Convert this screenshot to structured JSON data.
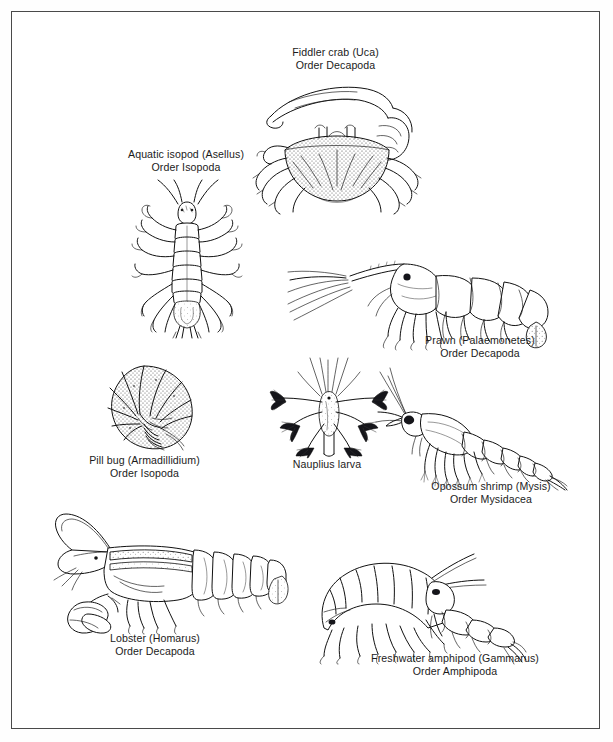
{
  "plate": {
    "title": "Crustacean diversity plate",
    "background_color": "#ffffff",
    "border_color": "#4a4a4a",
    "ink_color": "#111111",
    "caption_color": "#1b1b1b"
  },
  "figures": [
    {
      "id": "fiddler-crab",
      "common_name": "Fiddler crab (Uca)",
      "order": "Order Decapoda",
      "caption_lines": [
        "Fiddler crab (Uca)",
        "Order Decapoda"
      ]
    },
    {
      "id": "aquatic-isopod",
      "common_name": "Aquatic isopod (Asellus)",
      "order": "Order Isopoda",
      "caption_lines": [
        "Aquatic isopod (Asellus)",
        "Order Isopoda"
      ]
    },
    {
      "id": "prawn",
      "common_name": "Prawn (Palaemonetes)",
      "order": "Order Decapoda",
      "caption_lines": [
        "Prawn (Palaemonetes)",
        "Order Decapoda"
      ]
    },
    {
      "id": "pill-bug",
      "common_name": "Pill bug (Armadillidium)",
      "order": "Order Isopoda",
      "caption_lines": [
        "Pill bug (Armadillidium)",
        "Order Isopoda"
      ]
    },
    {
      "id": "nauplius-larva",
      "common_name": "Nauplius larva",
      "order": "",
      "caption_lines": [
        "Nauplius larva",
        ""
      ]
    },
    {
      "id": "opossum-shrimp",
      "common_name": "Opossum shrimp (Mysis)",
      "order": "Order Mysidacea",
      "caption_lines": [
        "Opossum shrimp (Mysis)",
        "Order Mysidacea"
      ]
    },
    {
      "id": "lobster",
      "common_name": "Lobster (Homarus)",
      "order": "Order Decapoda",
      "caption_lines": [
        "Lobster (Homarus)",
        "Order Decapoda"
      ]
    },
    {
      "id": "freshwater-amphipod",
      "common_name": "Freshwater amphipod (Gammarus)",
      "order": "Order Amphipoda",
      "caption_lines": [
        "Freshwater amphipod (Gammarus)",
        "Order Amphipoda"
      ]
    }
  ]
}
